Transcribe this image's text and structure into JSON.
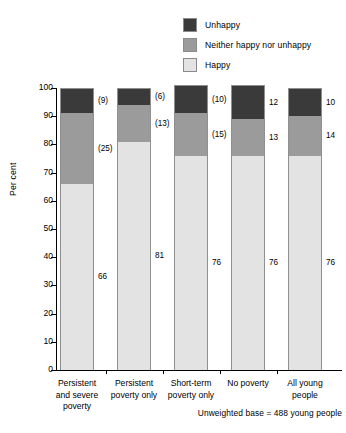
{
  "legend": {
    "items": [
      {
        "label": "Unhappy",
        "color": "#3a3a3a"
      },
      {
        "label": "Neither happy nor unhappy",
        "color": "#9b9b9b"
      },
      {
        "label": "Happy",
        "color": "#e3e3e3"
      }
    ]
  },
  "footnote": "Unweighted base = 488 young people",
  "chart_data": {
    "type": "bar",
    "title": "",
    "subtitle": "",
    "xlabel": "",
    "ylabel": "Per cent",
    "ylim": [
      0,
      100
    ],
    "ytick_step": 10,
    "yticks": [
      "0",
      "10",
      "20",
      "30",
      "40",
      "50",
      "60",
      "70",
      "80",
      "90",
      "100"
    ],
    "grid": false,
    "stacked": true,
    "legend_position": "top-right",
    "categories": [
      "Persistent and severe poverty",
      "Persistent poverty only",
      "Short-term poverty only",
      "No poverty",
      "All young people"
    ],
    "category_lines": [
      [
        "Persistent",
        "and severe",
        "poverty"
      ],
      [
        "Persistent",
        "poverty only"
      ],
      [
        "Short-term",
        "poverty only"
      ],
      [
        "No poverty"
      ],
      [
        "All young",
        "people"
      ]
    ],
    "series": [
      {
        "name": "Happy",
        "color": "#e3e3e3",
        "values": [
          66,
          81,
          76,
          76,
          76
        ],
        "labels": [
          "66",
          "81",
          "76",
          "76",
          "76"
        ]
      },
      {
        "name": "Neither happy nor unhappy",
        "color": "#9b9b9b",
        "values": [
          25,
          13,
          15,
          13,
          14
        ],
        "labels": [
          "(25)",
          "(13)",
          "(15)",
          "13",
          "14"
        ]
      },
      {
        "name": "Unhappy",
        "color": "#3a3a3a",
        "values": [
          9,
          6,
          10,
          12,
          10
        ],
        "labels": [
          "(9)",
          "(6)",
          "(10)",
          "12",
          "10"
        ]
      }
    ]
  }
}
